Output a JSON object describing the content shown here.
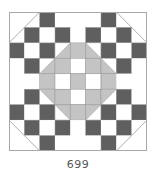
{
  "block": {
    "label": "699",
    "grid_size": 9,
    "colors": {
      "white": "#ffffff",
      "dark": "#5f5f5f",
      "grey": "#c4c4c4",
      "line": "#9a9a9a",
      "border": "#a8a8a8"
    },
    "cells": [
      [
        "W",
        "W",
        "D",
        "W",
        "W",
        "W",
        "D",
        "W",
        "W"
      ],
      [
        "W",
        "D",
        "W",
        "D",
        "W",
        "D",
        "W",
        "D",
        "W"
      ],
      [
        "D",
        "W",
        "D",
        "T_BR",
        "G",
        "T_BL",
        "D",
        "W",
        "D"
      ],
      [
        "W",
        "D",
        "T_BR",
        "G",
        "W",
        "G",
        "T_BL",
        "D",
        "W"
      ],
      [
        "W",
        "W",
        "G",
        "W",
        "G",
        "W",
        "G",
        "W",
        "W"
      ],
      [
        "W",
        "D",
        "T_TR",
        "G",
        "W",
        "G",
        "T_TL",
        "D",
        "W"
      ],
      [
        "D",
        "W",
        "D",
        "T_TR",
        "G",
        "T_TL",
        "D",
        "W",
        "D"
      ],
      [
        "W",
        "D",
        "W",
        "D",
        "W",
        "D",
        "W",
        "D",
        "W"
      ],
      [
        "W",
        "W",
        "D",
        "W",
        "W",
        "W",
        "D",
        "W",
        "W"
      ]
    ],
    "corner_lines": [
      {
        "name": "top-left",
        "from": [
          0,
          2
        ],
        "to": [
          2,
          0
        ]
      },
      {
        "name": "top-right",
        "from": [
          7,
          0
        ],
        "to": [
          9,
          2
        ]
      },
      {
        "name": "bottom-left",
        "from": [
          0,
          7
        ],
        "to": [
          2,
          9
        ]
      },
      {
        "name": "bottom-right",
        "from": [
          9,
          7
        ],
        "to": [
          7,
          9
        ]
      }
    ]
  }
}
